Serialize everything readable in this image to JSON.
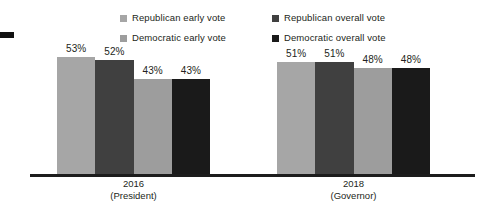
{
  "chart_data": {
    "type": "bar",
    "title": "",
    "subtitle": "",
    "xlabel": "",
    "ylabel": "",
    "ylim": [
      0,
      60
    ],
    "grid": false,
    "legend_position": "top",
    "value_suffix": "%",
    "categories": [
      "2016\n(President)",
      "2018\n(Governor)"
    ],
    "groups": [
      {
        "label_line1": "2016",
        "label_line2": "(President)",
        "values": [
          53,
          52,
          43,
          43
        ],
        "value_labels": [
          "53%",
          "52%",
          "43%",
          "43%"
        ]
      },
      {
        "label_line1": "2018",
        "label_line2": "(Governor)",
        "values": [
          51,
          51,
          48,
          48
        ],
        "value_labels": [
          "51%",
          "51%",
          "48%",
          "48%"
        ]
      }
    ],
    "series": [
      {
        "name": "Republican early vote",
        "color": "#a6a6a6",
        "values": [
          53,
          51
        ]
      },
      {
        "name": "Republican overall vote",
        "color": "#404040",
        "values": [
          52,
          51
        ]
      },
      {
        "name": "Democratic early vote",
        "color": "#9d9d9d",
        "values": [
          43,
          48
        ]
      },
      {
        "name": "Democratic overall vote",
        "color": "#1a1a1a",
        "values": [
          43,
          48
        ]
      }
    ]
  },
  "legend": {
    "items": [
      {
        "label": "Republican early vote",
        "color": "#a6a6a6"
      },
      {
        "label": "Republican overall vote",
        "color": "#404040"
      },
      {
        "label": "Democratic early vote",
        "color": "#9d9d9d"
      },
      {
        "label": "Democratic overall vote",
        "color": "#1a1a1a"
      }
    ]
  },
  "colors": {
    "republican_early": "#a6a6a6",
    "republican_overall": "#404040",
    "democratic_early": "#9d9d9d",
    "democratic_overall": "#1a1a1a",
    "axis": "#1c1c1c",
    "text": "#231f20",
    "background": "#ffffff"
  }
}
